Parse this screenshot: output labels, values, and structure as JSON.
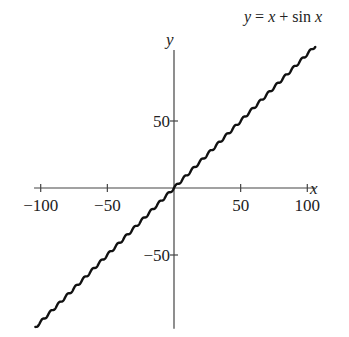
{
  "chart_data": {
    "type": "line",
    "title": "y = x + sin x",
    "xlabel": "x",
    "ylabel": "y",
    "xlim": [
      -105,
      106
    ],
    "ylim": [
      -105,
      103
    ],
    "grid": false,
    "legend": null,
    "x_ticks": [
      -100,
      -50,
      50,
      100
    ],
    "x_tick_labels": [
      "−100",
      "−50",
      "50",
      "100"
    ],
    "y_ticks": [
      50,
      -50
    ],
    "y_tick_labels": [
      "50",
      "−50"
    ],
    "series": [
      {
        "name": "y = x + sin x",
        "function": "x + sin(x)",
        "x_range": [
          -104,
          106
        ],
        "sample_points": [
          {
            "x": -100,
            "y": -100.51
          },
          {
            "x": -50,
            "y": -49.74
          },
          {
            "x": 0,
            "y": 0
          },
          {
            "x": 50,
            "y": 49.74
          },
          {
            "x": 100,
            "y": 99.49
          }
        ]
      }
    ],
    "colors": {
      "curve": "#111111",
      "axes": "#444444"
    }
  },
  "layout": {
    "origin_px": [
      174,
      188
    ],
    "px_per_unit_x": 1.333,
    "px_per_unit_y": 1.34
  }
}
